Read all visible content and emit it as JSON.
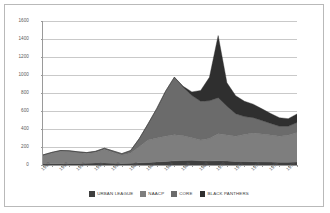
{
  "chart_data": {
    "type": "area",
    "stacked": true,
    "title": "",
    "subtitle": "",
    "xlabel": "",
    "ylabel": "",
    "xlim": [
      1950,
      1979
    ],
    "ylim": [
      0,
      1600
    ],
    "ytick_step": 200,
    "yticks": [
      0,
      200,
      400,
      600,
      800,
      1000,
      1200,
      1400,
      1600
    ],
    "ytick_labels": [
      "0",
      "200",
      "400",
      "600",
      "800",
      "1000",
      "1200",
      "1400",
      "1600"
    ],
    "grid": true,
    "grid_axis": "y",
    "legend_position": "bottom",
    "categories": [
      1950,
      1951,
      1952,
      1953,
      1954,
      1955,
      1956,
      1957,
      1958,
      1959,
      1960,
      1961,
      1962,
      1963,
      1964,
      1965,
      1966,
      1967,
      1968,
      1969,
      1970,
      1971,
      1972,
      1973,
      1974,
      1975,
      1976,
      1977,
      1978,
      1979
    ],
    "xtick_labels": [
      "1950",
      "1952",
      "1954",
      "1956",
      "1958",
      "1960",
      "1962",
      "1964",
      "1966",
      "1968",
      "1970",
      "1972",
      "1974",
      "1976",
      "1978"
    ],
    "series": [
      {
        "name": "URBAN LEAGUE",
        "color": "#3f3f3f",
        "values": [
          12,
          14,
          15,
          16,
          18,
          20,
          22,
          22,
          20,
          18,
          20,
          24,
          28,
          34,
          40,
          46,
          50,
          52,
          48,
          44,
          48,
          44,
          40,
          38,
          36,
          34,
          32,
          30,
          30,
          32
        ]
      },
      {
        "name": "NAACP",
        "color": "#7e7e7e",
        "values": [
          95,
          120,
          140,
          135,
          120,
          108,
          118,
          150,
          120,
          90,
          110,
          180,
          250,
          265,
          280,
          290,
          275,
          250,
          230,
          250,
          300,
          290,
          280,
          300,
          320,
          310,
          300,
          290,
          300,
          330
        ]
      },
      {
        "name": "CORE",
        "color": "#6b6b6b",
        "values": [
          5,
          6,
          6,
          7,
          8,
          10,
          12,
          14,
          16,
          18,
          30,
          90,
          180,
          330,
          500,
          640,
          540,
          470,
          430,
          420,
          400,
          320,
          250,
          200,
          170,
          150,
          130,
          110,
          100,
          110
        ]
      },
      {
        "name": "BLACK PANTHERS",
        "color": "#2f2f2f",
        "values": [
          0,
          0,
          0,
          0,
          0,
          0,
          0,
          0,
          0,
          0,
          0,
          0,
          0,
          0,
          0,
          0,
          10,
          40,
          120,
          260,
          690,
          260,
          200,
          170,
          150,
          130,
          110,
          95,
          85,
          95
        ]
      }
    ],
    "annotations": [
      {
        "label": "peak total",
        "x": 1964,
        "y": 1200
      },
      {
        "label": "peak total",
        "x": 1970,
        "y": 1440
      }
    ]
  },
  "legend": {
    "items": [
      {
        "label": "URBAN LEAGUE",
        "color": "#3f3f3f"
      },
      {
        "label": "NAACP",
        "color": "#7e7e7e"
      },
      {
        "label": "CORE",
        "color": "#6b6b6b"
      },
      {
        "label": "BLACK PANTHERS",
        "color": "#2f2f2f"
      }
    ]
  }
}
